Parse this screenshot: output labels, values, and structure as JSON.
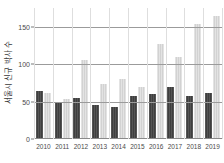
{
  "chart_data": {
    "type": "bar",
    "title": "",
    "xlabel": "",
    "ylabel": "서울시 신규 박사 수",
    "categories": [
      "2010",
      "2011",
      "2012",
      "2013",
      "2014",
      "2015",
      "2016",
      "2017",
      "2018",
      "2019"
    ],
    "series": [
      {
        "name": "series-dark",
        "color": "#4d4d4d",
        "values": [
          64,
          48,
          55,
          45,
          43,
          57,
          60,
          70,
          58,
          62
        ]
      },
      {
        "name": "series-light",
        "color": "#dcdcdc",
        "values": [
          61,
          54,
          106,
          73,
          80,
          70,
          127,
          109,
          153,
          164
        ]
      }
    ],
    "ylim": [
      0,
      175
    ],
    "yticks": [
      0,
      50,
      100,
      150
    ],
    "ytick_labels": [
      "0",
      "50",
      "100",
      "150"
    ],
    "grid": true,
    "legend": "none"
  }
}
